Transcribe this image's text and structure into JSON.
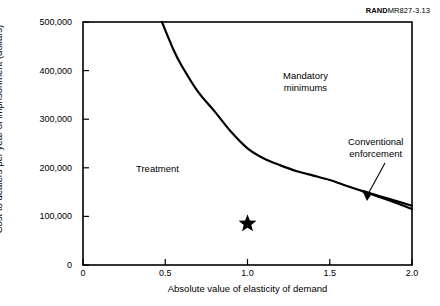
{
  "source_credit": {
    "brand": "RAND",
    "figure_id": "MR827-3.13"
  },
  "chart_data": {
    "type": "line",
    "title": "",
    "xlabel": "Absolute value of elasticity of demand",
    "ylabel": "Cost to dealers per year of imprisonment (dollars)",
    "xlim": [
      0,
      2.0
    ],
    "ylim": [
      0,
      500000
    ],
    "xticks": [
      "0",
      "0.5",
      "1.0",
      "1.5",
      "2.0"
    ],
    "xtick_values": [
      0,
      0.5,
      1.0,
      1.5,
      2.0
    ],
    "yticks": [
      "0",
      "100,000",
      "200,000",
      "300,000",
      "400,000",
      "500,000"
    ],
    "ytick_values": [
      0,
      100000,
      200000,
      300000,
      400000,
      500000
    ],
    "grid": false,
    "legend": "none",
    "series": [
      {
        "name": "Mandatory minimums vs. treatment threshold",
        "x": [
          0.48,
          0.55,
          0.6,
          0.7,
          0.8,
          0.9,
          1.0,
          1.1,
          1.2,
          1.3,
          1.4,
          1.5,
          1.6,
          1.7,
          1.8,
          1.9,
          2.0
        ],
        "values": [
          500000,
          443000,
          410000,
          356000,
          316000,
          274000,
          240000,
          219000,
          205000,
          193000,
          184000,
          175000,
          163000,
          152000,
          142000,
          132000,
          122000
        ]
      },
      {
        "name": "Conventional enforcement",
        "x": [
          1.7,
          1.8,
          1.9,
          2.0
        ],
        "values": [
          152000,
          140000,
          128000,
          115000
        ]
      }
    ],
    "markers": [
      {
        "name": "current-policy-point",
        "symbol": "star",
        "x": 1.0,
        "y": 85000,
        "color": "#000000"
      }
    ],
    "annotations": [
      {
        "name": "treatment",
        "text": "Treatment",
        "x": 0.33,
        "y": 295000
      },
      {
        "name": "mandatory-minimums",
        "text": "Mandatory\nminimums",
        "x": 1.28,
        "y": 408000
      },
      {
        "name": "conventional-enforcement",
        "text": "Conventional\nenforcement",
        "x": 1.78,
        "y": 272000
      }
    ],
    "region_labels": {
      "treatment": "Treatment",
      "mandatory_minimums_line1": "Mandatory",
      "mandatory_minimums_line2": "minimums",
      "conventional_enforcement_line1": "Conventional",
      "conventional_enforcement_line2": "enforcement"
    },
    "colors": {
      "curve": "#000000",
      "axis": "#000000",
      "marker": "#000000",
      "background": "#ffffff"
    }
  }
}
